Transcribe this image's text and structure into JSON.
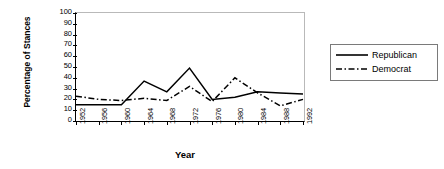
{
  "chart_data": {
    "type": "line",
    "title": "",
    "xlabel": "Year",
    "ylabel": "Percentage of Stances",
    "categories": [
      "1952",
      "1956",
      "1960",
      "1964",
      "1968",
      "1972",
      "1976",
      "1980",
      "1984",
      "1988",
      "1992"
    ],
    "ylim": [
      0,
      100
    ],
    "yticks": [
      0,
      10,
      20,
      30,
      40,
      50,
      60,
      70,
      80,
      90,
      100
    ],
    "grid": false,
    "legend_position": "right",
    "series": [
      {
        "name": "Republican",
        "style": "solid",
        "color": "#000000",
        "values": [
          15,
          15,
          15,
          37,
          27,
          49,
          20,
          22,
          27,
          26,
          25
        ]
      },
      {
        "name": "Democrat",
        "style": "dash-dot",
        "color": "#000000",
        "values": [
          23,
          20,
          19,
          21,
          19,
          32,
          18,
          40,
          26,
          14,
          20
        ]
      }
    ]
  },
  "legend": {
    "items": [
      {
        "label": "Republican",
        "key": "solid-line-key"
      },
      {
        "label": "Democrat",
        "key": "dash-dot-line-key"
      }
    ]
  },
  "axes": {
    "y_title": "Percentage of Stances",
    "x_title": "Year"
  }
}
